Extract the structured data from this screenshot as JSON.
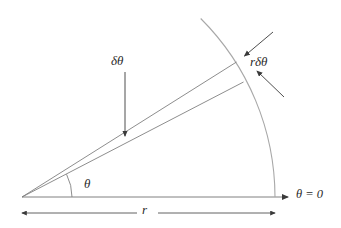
{
  "figure": {
    "kind": "polar-sector-diagram",
    "background_color": "#ffffff",
    "line_color": "#808080",
    "arrow_color": "#3a3a3a",
    "text_color": "#2b2b2b",
    "width": 341,
    "height": 228
  },
  "labels": {
    "delta_theta": "δθ",
    "r_delta_theta": "rδθ",
    "theta_angle": "θ",
    "theta_zero": "θ = 0",
    "radius": "r"
  },
  "geometry": {
    "vertex": {
      "x": 22,
      "y": 197
    },
    "baseline_end": {
      "x": 275,
      "y": 197
    },
    "radius_length": 253,
    "upper_ray_angle_deg": 32,
    "lower_ray_angle_deg": 27,
    "arc_start_angle_deg": 0,
    "arc_end_angle_deg": 48,
    "angle_marker_radius": 50,
    "dimension_line_y": 213
  },
  "annotations": {
    "delta_theta_arrow": {
      "from": {
        "x": 125,
        "y": 72
      },
      "to": {
        "x": 125,
        "y": 136
      }
    },
    "r_delta_theta_arrow_upper": {
      "from": {
        "x": 272,
        "y": 33
      },
      "to": {
        "x": 243,
        "y": 57
      }
    },
    "r_delta_theta_arrow_lower": {
      "from": {
        "x": 283,
        "y": 96
      },
      "to": {
        "x": 256,
        "y": 71
      }
    },
    "theta_zero_arrow": {
      "from": {
        "x": 265,
        "y": 197
      },
      "to": {
        "x": 290,
        "y": 197
      }
    }
  }
}
